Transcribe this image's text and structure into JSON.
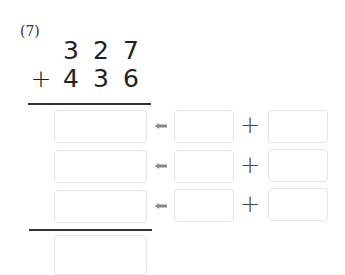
{
  "problem": {
    "label": "(7)",
    "addend1": [
      "3",
      "2",
      "7"
    ],
    "operator": "+",
    "addend2": [
      "4",
      "3",
      "6"
    ]
  },
  "rows": [
    {
      "result": "",
      "left": "",
      "plus": "+",
      "right": ""
    },
    {
      "result": "",
      "left": "",
      "plus": "+",
      "right": ""
    },
    {
      "result": "",
      "left": "",
      "plus": "+",
      "right": ""
    }
  ],
  "total": {
    "value": ""
  },
  "icons": {
    "arrow": "arrow-left-icon",
    "plus": "plus-icon"
  },
  "colors": {
    "box_border": "#e3e3e3",
    "arrow": "#888888",
    "text": "#222222"
  }
}
